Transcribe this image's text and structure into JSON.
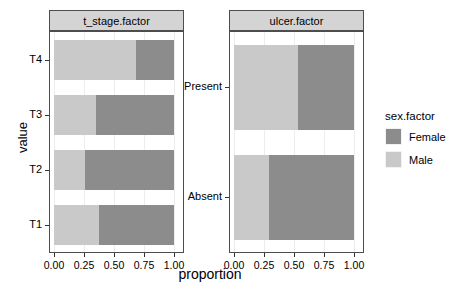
{
  "chart_data": {
    "type": "bar",
    "orientation": "horizontal",
    "stacked": true,
    "stack_mode": "fill",
    "title": "",
    "xlabel": "proportion",
    "ylabel": "value",
    "xlim": [
      0,
      1
    ],
    "grid": true,
    "legend_position": "right",
    "legend_title": "sex.factor",
    "series": [
      {
        "name": "Male",
        "color": "#c9c9c9"
      },
      {
        "name": "Female",
        "color": "#8c8c8c"
      }
    ],
    "facets": [
      {
        "label": "t_stage.factor",
        "categories": [
          "T4",
          "T3",
          "T2",
          "T1"
        ],
        "bars": [
          {
            "category": "T4",
            "Male": 0.68,
            "Female": 0.32
          },
          {
            "category": "T3",
            "Male": 0.35,
            "Female": 0.65
          },
          {
            "category": "T2",
            "Male": 0.26,
            "Female": 0.74
          },
          {
            "category": "T1",
            "Male": 0.375,
            "Female": 0.625
          }
        ]
      },
      {
        "label": "ulcer.factor",
        "categories": [
          "Present",
          "Absent"
        ],
        "bars": [
          {
            "category": "Present",
            "Male": 0.53,
            "Female": 0.47
          },
          {
            "category": "Absent",
            "Male": 0.29,
            "Female": 0.71
          }
        ]
      }
    ],
    "xticks": [
      {
        "value": 0.0,
        "label": "0.00"
      },
      {
        "value": 0.25,
        "label": "0.25"
      },
      {
        "value": 0.5,
        "label": "0.50"
      },
      {
        "value": 0.75,
        "label": "0.75"
      },
      {
        "value": 1.0,
        "label": "1.00"
      }
    ]
  },
  "axis": {
    "y_title": "value",
    "x_title": "proportion"
  },
  "legend": {
    "title": "sex.factor",
    "entries": [
      {
        "label": "Female",
        "color": "#8c8c8c"
      },
      {
        "label": "Male",
        "color": "#c9c9c9"
      }
    ]
  },
  "colors": {
    "female": "#8c8c8c",
    "male": "#c9c9c9",
    "strip_bg": "#d4d4d4",
    "panel_border": "#4d4d4d",
    "gridline": "#ededed",
    "text": "#000000"
  }
}
